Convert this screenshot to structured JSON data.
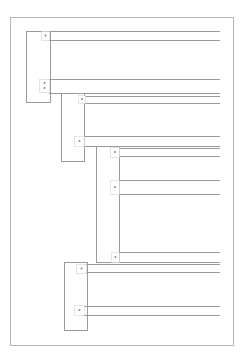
{
  "diagram": {
    "title": "",
    "colors": {
      "line": "#9a9a9a",
      "frame": "#b4b4b4",
      "port": "#c8c8c8",
      "dot": "#8a8a8a"
    },
    "frame": {
      "x": 10,
      "y": 17,
      "w": 223,
      "h": 328
    },
    "blocks": [
      {
        "id": "block-1",
        "x": 26,
        "y": 31,
        "w": 24,
        "h": 71
      },
      {
        "id": "block-2",
        "x": 61,
        "y": 93,
        "w": 23,
        "h": 68
      },
      {
        "id": "block-3",
        "x": 96,
        "y": 146,
        "w": 23,
        "h": 116
      },
      {
        "id": "block-4",
        "x": 64,
        "y": 262,
        "w": 23,
        "h": 68
      }
    ],
    "ports": [
      {
        "id": "port-1",
        "x": 41,
        "y": 31,
        "w": 8,
        "h": 9,
        "dots": [
          35.5
        ]
      },
      {
        "id": "port-2",
        "x": 39,
        "y": 79,
        "w": 10,
        "h": 13,
        "dots": [
          83,
          88
        ]
      },
      {
        "id": "port-3",
        "x": 78,
        "y": 95,
        "w": 7,
        "h": 8,
        "dots": [
          99
        ]
      },
      {
        "id": "port-4",
        "x": 74,
        "y": 136,
        "w": 10,
        "h": 10,
        "dots": [
          141
        ]
      },
      {
        "id": "port-5",
        "x": 110,
        "y": 147,
        "w": 9,
        "h": 10,
        "dots": [
          152
        ]
      },
      {
        "id": "port-6",
        "x": 110,
        "y": 180,
        "w": 9,
        "h": 14,
        "dots": [
          187
        ]
      },
      {
        "id": "port-7",
        "x": 111,
        "y": 252,
        "w": 8,
        "h": 10,
        "dots": [
          257
        ]
      },
      {
        "id": "port-8",
        "x": 76,
        "y": 264,
        "w": 10,
        "h": 9,
        "dots": [
          268.5
        ]
      },
      {
        "id": "port-9",
        "x": 74,
        "y": 305,
        "w": 10,
        "h": 10,
        "dots": [
          310
        ]
      }
    ],
    "wires": [
      {
        "x1": 49,
        "y": 31,
        "x2": 220
      },
      {
        "x1": 49,
        "y": 40,
        "x2": 220
      },
      {
        "x1": 49,
        "y": 79,
        "x2": 220
      },
      {
        "x1": 49,
        "y": 93,
        "x2": 220
      },
      {
        "x1": 84,
        "y": 96,
        "x2": 220
      },
      {
        "x1": 84,
        "y": 103,
        "x2": 220
      },
      {
        "x1": 84,
        "y": 136,
        "x2": 220
      },
      {
        "x1": 84,
        "y": 146,
        "x2": 220
      },
      {
        "x1": 119,
        "y": 148,
        "x2": 220
      },
      {
        "x1": 119,
        "y": 156,
        "x2": 220
      },
      {
        "x1": 119,
        "y": 180,
        "x2": 220
      },
      {
        "x1": 119,
        "y": 194,
        "x2": 220
      },
      {
        "x1": 119,
        "y": 252,
        "x2": 220
      },
      {
        "x1": 119,
        "y": 262,
        "x2": 220
      },
      {
        "x1": 86,
        "y": 264,
        "x2": 220
      },
      {
        "x1": 86,
        "y": 272,
        "x2": 220
      },
      {
        "x1": 84,
        "y": 306,
        "x2": 220
      },
      {
        "x1": 84,
        "y": 315,
        "x2": 220
      }
    ]
  }
}
